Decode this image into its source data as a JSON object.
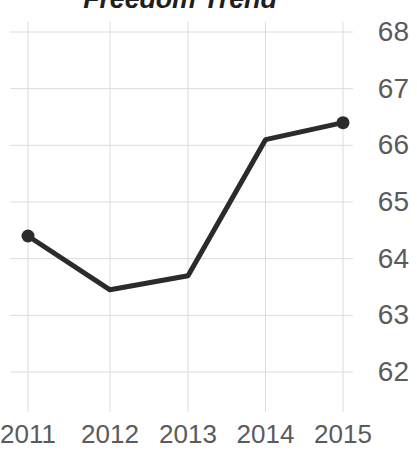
{
  "chart_data": {
    "type": "line",
    "title": "Freedom Trend",
    "xlabel": "",
    "ylabel": "",
    "categories": [
      "2011",
      "2012",
      "2013",
      "2014",
      "2015"
    ],
    "values": [
      64.4,
      63.45,
      63.7,
      66.1,
      66.4
    ],
    "series": [
      {
        "name": "Freedom",
        "values": [
          64.4,
          63.45,
          63.7,
          66.1,
          66.4
        ]
      }
    ],
    "xlim": [
      2011,
      2015
    ],
    "ylim": [
      62,
      68
    ],
    "y_ticks": [
      "68",
      "67",
      "66",
      "65",
      "64",
      "63",
      "62"
    ],
    "y_tick_values": [
      68,
      67,
      66,
      65,
      64,
      63,
      62
    ],
    "x_ticks": [
      "2011",
      "2012",
      "2013",
      "2014",
      "2015"
    ],
    "grid": true,
    "grid_color": "#dcdcdc",
    "legend": "none",
    "y_axis_position": "right",
    "line_color": "#2b2b2b",
    "marker_color": "#2b2b2b",
    "marker_style": "circle",
    "title_color": "#1f1f1f",
    "tick_label_color": "#5b5b5b",
    "background_color": "#ffffff"
  }
}
